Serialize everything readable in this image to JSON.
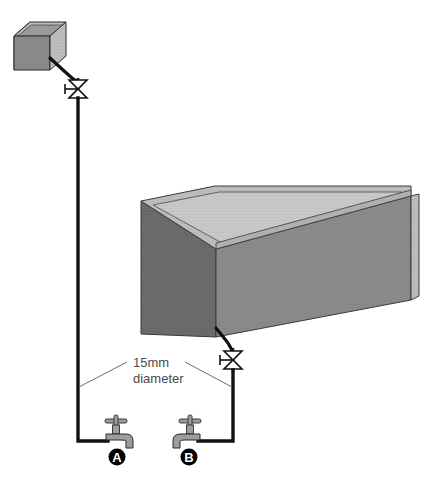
{
  "diagram": {
    "background_color": "#ffffff",
    "pipe_color": "#111111",
    "leader_color": "#6e6e6e"
  },
  "cistern": {
    "name": "small-header-tank",
    "label": "",
    "face_front_color": "#8f8f8f",
    "face_left_color": "#6b6b6b",
    "face_inner_color": "#c2c2c2",
    "rim_color": "#b5b5b5",
    "outline_color": "#2b2b2b"
  },
  "main_tank": {
    "name": "large-storage-tank",
    "label": "",
    "face_front_color": "#8a8a8a",
    "face_left_color": "#6b6b6b",
    "face_inner_floor_color": "#c8c8c8",
    "face_inner_back_color": "#a8a8a8",
    "rim_top_color": "#bdbdbd",
    "outline_color": "#3a3a3a"
  },
  "valves": [
    {
      "name": "valve-upper",
      "position": "on cistern downpipe",
      "symbol": "gate-valve-bowtie",
      "body_color": "#ffffff",
      "outline_color": "#111111"
    },
    {
      "name": "valve-lower",
      "position": "on main tank outlet pipe",
      "symbol": "gate-valve-bowtie",
      "body_color": "#ffffff",
      "outline_color": "#111111"
    }
  ],
  "annotation": {
    "name": "pipe-diameter-callout",
    "line1": "15mm",
    "line2": "diameter",
    "color": "#4a4a4a"
  },
  "taps": [
    {
      "id": "A",
      "name": "tap-a",
      "orientation": "spout-right",
      "body_color": "#9d9d9d",
      "outline_color": "#2b2b2b",
      "badge_color": "#000000",
      "badge_text_color": "#ffffff"
    },
    {
      "id": "B",
      "name": "tap-b",
      "orientation": "spout-left",
      "body_color": "#9d9d9d",
      "outline_color": "#2b2b2b",
      "badge_color": "#000000",
      "badge_text_color": "#ffffff"
    }
  ]
}
